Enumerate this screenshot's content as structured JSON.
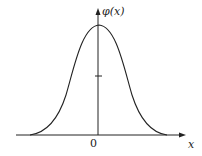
{
  "diagram": {
    "y_axis_label": "φ(x)",
    "x_axis_label": "x",
    "origin_label": "0",
    "curve": "bell-shaped curve symmetric about y-axis",
    "tick_marks": [
      "y-axis mid tick"
    ]
  }
}
